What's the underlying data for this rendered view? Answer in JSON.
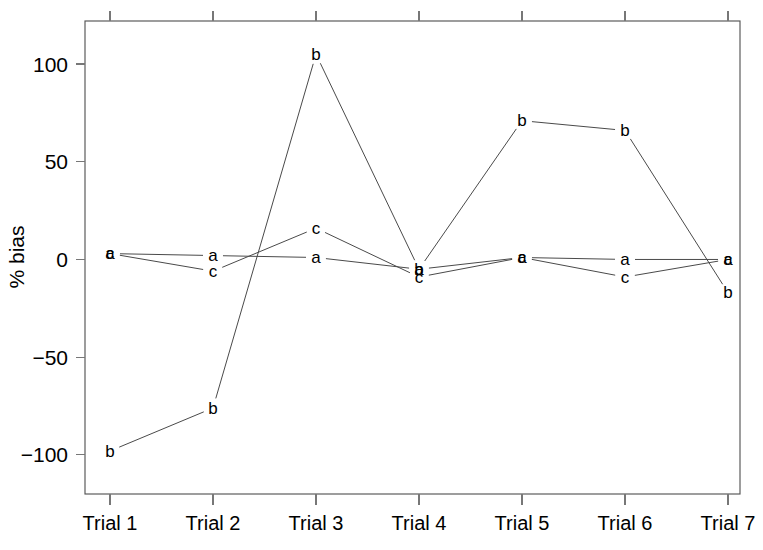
{
  "chart_data": {
    "type": "line",
    "title": "",
    "subtitle": "",
    "xlabel": "",
    "ylabel": "% bias",
    "categories": [
      "Trial 1",
      "Trial 2",
      "Trial 3",
      "Trial 4",
      "Trial 5",
      "Trial 6",
      "Trial 7"
    ],
    "series": [
      {
        "name": "a",
        "marker": "a",
        "values": [
          3,
          2,
          1,
          -5,
          1,
          0,
          0
        ]
      },
      {
        "name": "b",
        "marker": "b",
        "values": [
          -98,
          -76,
          105,
          -5,
          71,
          66,
          -17
        ]
      },
      {
        "name": "c",
        "marker": "c",
        "values": [
          3,
          -6,
          16,
          -9,
          1,
          -9,
          0
        ]
      }
    ],
    "ylim": [
      -120,
      122
    ],
    "yticks": [
      100,
      50,
      0,
      -50,
      -100
    ],
    "ytick_labels": [
      "100",
      "50",
      "0",
      "−50",
      "−100"
    ],
    "grid": false,
    "legend": "none",
    "marker_style": "letter-labels",
    "line_color": "#4a4a4a",
    "axis_color": "#555555",
    "text_color": "#000000",
    "background": "#ffffff",
    "box_frame": true
  }
}
